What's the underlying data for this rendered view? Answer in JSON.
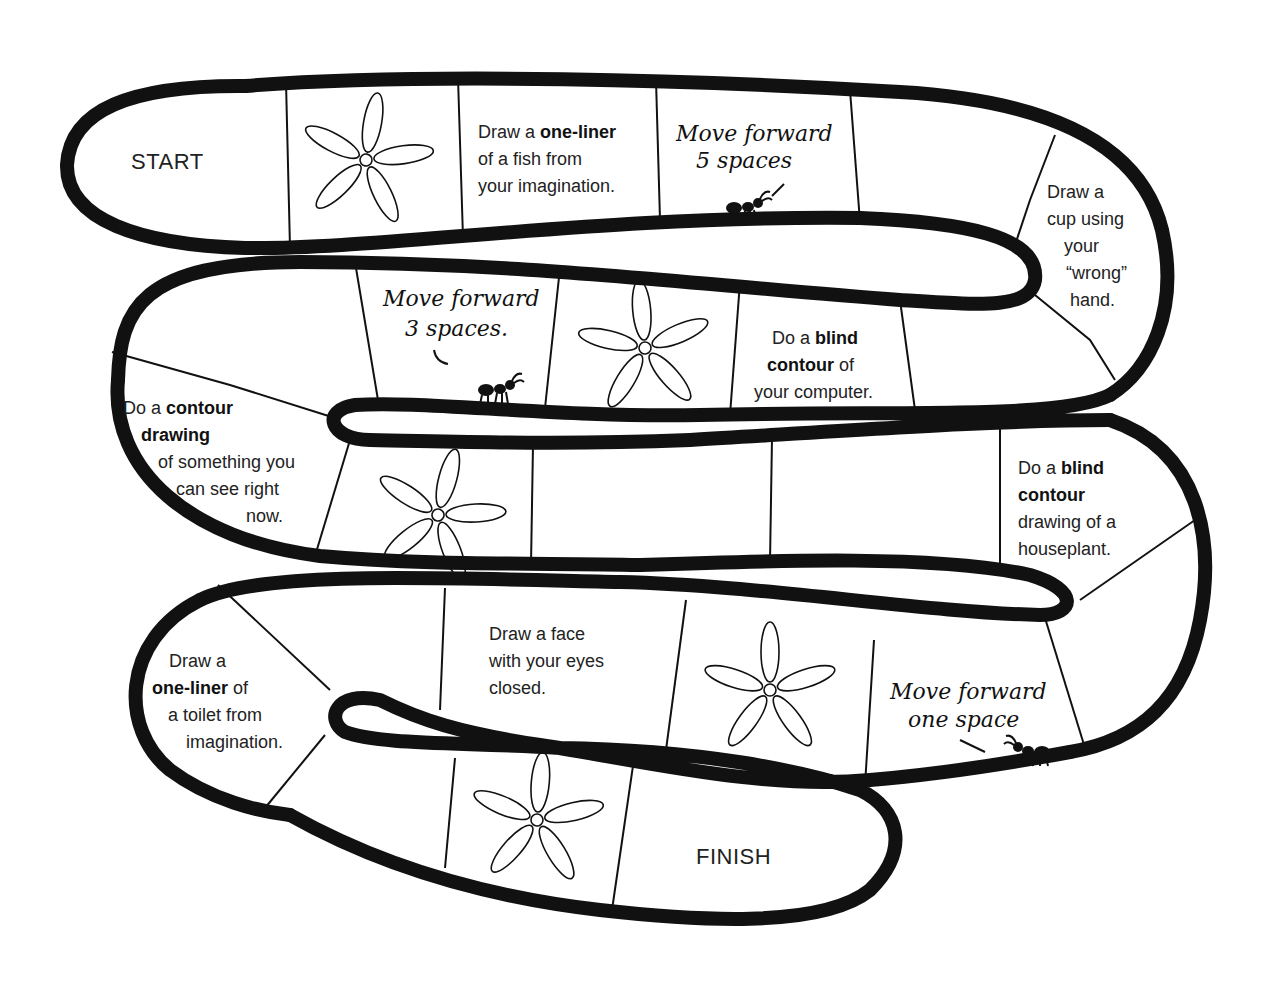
{
  "board": {
    "type": "drawing-prompt board game",
    "colors": {
      "outline": "#111111",
      "background": "#ffffff",
      "text": "#222222"
    }
  },
  "spaces": {
    "start": {
      "label": "START"
    },
    "s1": {
      "icon": "flower-icon"
    },
    "s2": {
      "pre": "Draw a ",
      "bold": "one-liner",
      "l2": "of a fish from",
      "l3": "your imagination."
    },
    "s3": {
      "l1": "Move forward",
      "l2": "5 spaces",
      "icon": "ant-icon"
    },
    "s4": {
      "empty": true
    },
    "s5": {
      "l1": "Draw a",
      "l2": "cup using",
      "l3": "your",
      "l4": "“wrong”",
      "l5": "hand."
    },
    "s6": {
      "empty": true
    },
    "s7": {
      "pre": "Do a ",
      "bold": "blind",
      "bold2": "contour",
      "post2": " of",
      "l3": "your computer."
    },
    "s8": {
      "icon": "flower-icon"
    },
    "s9": {
      "l1": "Move forward",
      "l2": "3 spaces.",
      "icon": "ant-icon"
    },
    "s10": {
      "empty": true
    },
    "s11": {
      "pre": "Do a ",
      "bold": "contour",
      "bold2": "drawing",
      "l3": "of something you",
      "l4": "can see right",
      "l5": "now."
    },
    "s12": {
      "icon": "flower-icon"
    },
    "s13": {
      "empty": true
    },
    "s14": {
      "empty": true
    },
    "s15": {
      "pre": "Do a ",
      "bold": "blind",
      "bold2": "contour",
      "l3": "drawing of a",
      "l4": "houseplant."
    },
    "s16": {
      "empty": true
    },
    "s17": {
      "l1": "Move forward",
      "l2": "one space",
      "icon": "ant-icon"
    },
    "s18": {
      "icon": "flower-icon"
    },
    "s19": {
      "l1": "Draw a face",
      "l2": "with your eyes",
      "l3": "closed."
    },
    "s20": {
      "empty": true
    },
    "s21": {
      "l1": "Draw a",
      "bold": "one-liner",
      "post": " of",
      "l3": "a toilet from",
      "l4": "imagination."
    },
    "s22": {
      "empty": true
    },
    "s23": {
      "icon": "flower-icon"
    },
    "finish": {
      "label": "FINISH"
    }
  }
}
